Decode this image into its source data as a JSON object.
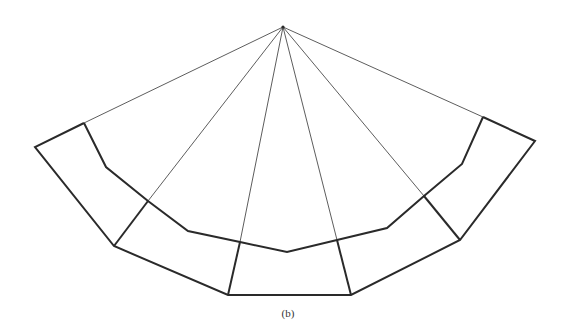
{
  "figure": {
    "caption": "(b)",
    "colors": {
      "line": "#2a2a2a",
      "background": "#ffffff"
    },
    "apex": [
      283,
      27
    ],
    "radial_lines": [
      [
        [
          283,
          27
        ],
        [
          84,
          123
        ]
      ],
      [
        [
          283,
          27
        ],
        [
          148,
          201
        ]
      ],
      [
        [
          283,
          27
        ],
        [
          240,
          242
        ]
      ],
      [
        [
          283,
          27
        ],
        [
          337,
          240
        ]
      ],
      [
        [
          283,
          27
        ],
        [
          424,
          196
        ]
      ],
      [
        [
          283,
          27
        ],
        [
          483,
          117
        ]
      ]
    ],
    "outer_polygon": [
      [
        84,
        123
      ],
      [
        35,
        147
      ],
      [
        114,
        246
      ],
      [
        228,
        295
      ],
      [
        351,
        295
      ],
      [
        460,
        240
      ],
      [
        535,
        141
      ],
      [
        483,
        117
      ]
    ],
    "inner_polyline": [
      [
        84,
        123
      ],
      [
        106,
        167
      ],
      [
        148,
        201
      ],
      [
        188,
        231
      ],
      [
        240,
        242
      ],
      [
        287,
        252
      ],
      [
        337,
        240
      ],
      [
        387,
        228
      ],
      [
        424,
        196
      ],
      [
        462,
        164
      ],
      [
        483,
        117
      ]
    ],
    "band_dividers": [
      [
        [
          148,
          201
        ],
        [
          114,
          246
        ]
      ],
      [
        [
          240,
          242
        ],
        [
          228,
          295
        ]
      ],
      [
        [
          337,
          240
        ],
        [
          351,
          295
        ]
      ],
      [
        [
          424,
          196
        ],
        [
          460,
          240
        ]
      ]
    ]
  }
}
